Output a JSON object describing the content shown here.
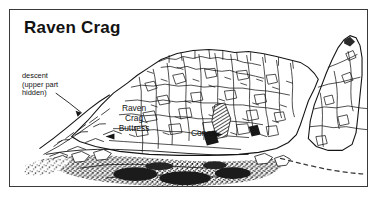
{
  "figure": {
    "title": "Raven Crag",
    "kind": "crag-topo-line-drawing",
    "frame_color": "#3a3a3a",
    "ink_color": "#141414",
    "paper_color": "#ffffff"
  },
  "annotations": {
    "descent": "descent\n(upper part\nhidden)",
    "buttress": "Raven\nCrag\nButtress",
    "corvus": "Corvus"
  },
  "features": {
    "dashed_path_label": "descent-path",
    "scree_label": "boulder-scree-base",
    "skyline_label": "crag-skyline"
  }
}
